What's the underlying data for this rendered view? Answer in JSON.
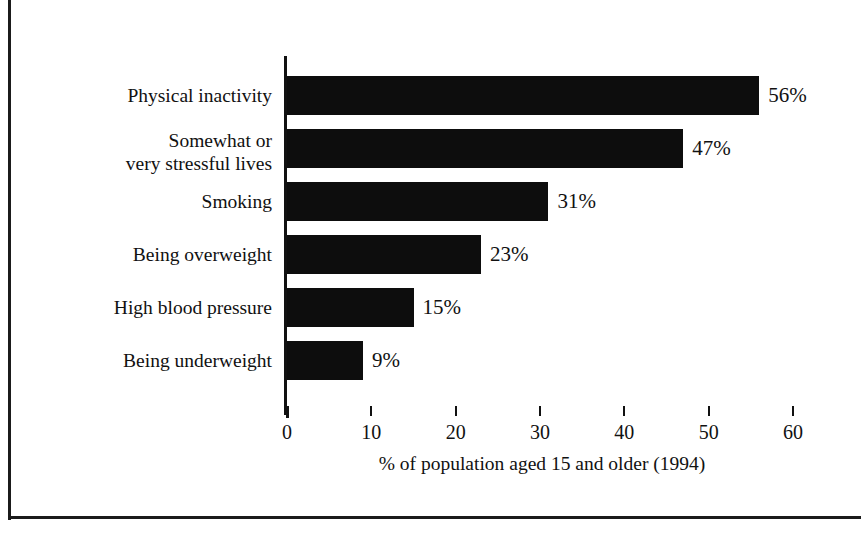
{
  "chart_data": {
    "type": "bar",
    "orientation": "horizontal",
    "title": "",
    "subtitle": "",
    "xlabel": "% of population aged 15 and older (1994)",
    "ylabel": "",
    "xlim": [
      0,
      60
    ],
    "xticks": [
      0,
      10,
      20,
      30,
      40,
      50,
      60
    ],
    "xtick_labels": [
      "0",
      "10",
      "20",
      "30",
      "40",
      "50",
      "60"
    ],
    "grid": false,
    "legend": false,
    "bar_color": "#0d0d0d",
    "categories": [
      "Physical inactivity",
      "Somewhat or\nvery stressful lives",
      "Smoking",
      "Being overweight",
      "High blood pressure",
      "Being underweight"
    ],
    "values": [
      56,
      47,
      31,
      23,
      15,
      9
    ],
    "value_labels": [
      "56%",
      "47%",
      "31%",
      "23%",
      "15%",
      "9%"
    ]
  },
  "axis": {
    "x_title": "% of population aged 15 and older (1994)",
    "ticks": [
      {
        "value": 0,
        "label": "0"
      },
      {
        "value": 10,
        "label": "10"
      },
      {
        "value": 20,
        "label": "20"
      },
      {
        "value": 30,
        "label": "30"
      },
      {
        "value": 40,
        "label": "40"
      },
      {
        "value": 50,
        "label": "50"
      },
      {
        "value": 60,
        "label": "60"
      }
    ]
  },
  "rows": [
    {
      "label": "Physical inactivity",
      "value": 56,
      "value_label": "56%",
      "lines": 1
    },
    {
      "label": "Somewhat or\nvery stressful lives",
      "value": 47,
      "value_label": "47%",
      "lines": 2
    },
    {
      "label": "Smoking",
      "value": 31,
      "value_label": "31%",
      "lines": 1
    },
    {
      "label": "Being overweight",
      "value": 23,
      "value_label": "23%",
      "lines": 1
    },
    {
      "label": "High blood pressure",
      "value": 15,
      "value_label": "15%",
      "lines": 1
    },
    {
      "label": "Being underweight",
      "value": 9,
      "value_label": "9%",
      "lines": 1
    }
  ]
}
